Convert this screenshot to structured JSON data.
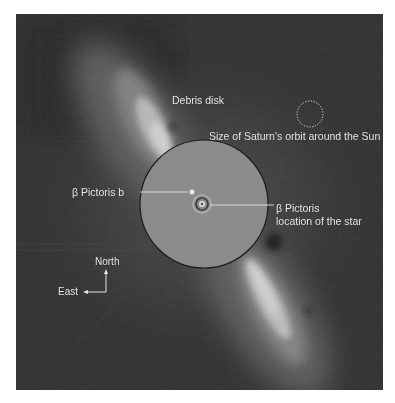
{
  "figure": {
    "background_color": "#3a3a3a",
    "mask_color": "#8a8a8a",
    "label_color": "#e8e8e8"
  },
  "labels": {
    "debris_disk": "Debris disk",
    "saturn_orbit": "Size of Saturn's orbit around the Sun",
    "planet": "β Pictoris b",
    "star_line1": "β Pictoris",
    "star_line2": "location of the star",
    "compass_north": "North",
    "compass_east": "East"
  },
  "icons": {
    "saturn_orbit_scale": "dotted-circle-icon",
    "compass": "compass-arrows-icon",
    "star": "star-icon",
    "planet": "planet-dot-icon"
  }
}
